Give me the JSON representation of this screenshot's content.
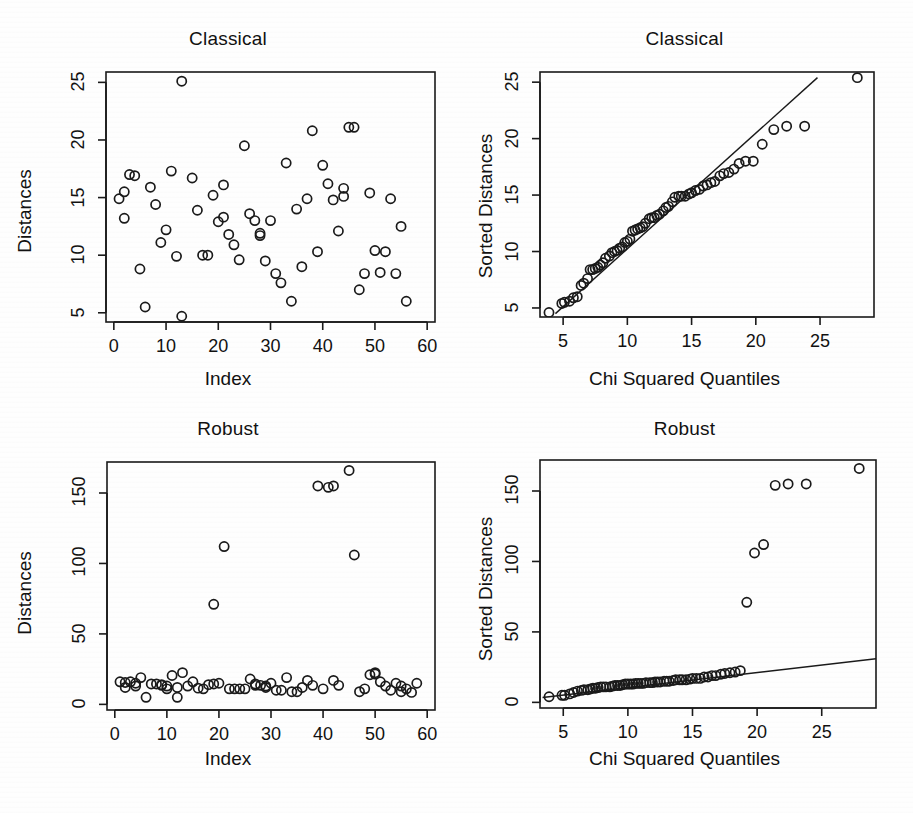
{
  "figure": {
    "width": 913,
    "height": 813,
    "background": "#fefefe",
    "ink": "#1a1a1a"
  },
  "chart_data": [
    {
      "panel_id": "classical-index",
      "type": "scatter",
      "title": "Classical",
      "xlabel": "Index",
      "ylabel": "Distances",
      "xlim": [
        -1.5,
        61.5
      ],
      "ylim": [
        4.2,
        25.9
      ],
      "xticks": [
        0,
        10,
        20,
        30,
        40,
        50,
        60
      ],
      "yticks": [
        5,
        10,
        15,
        20,
        25
      ],
      "grid": false,
      "legend": null,
      "marker": "open-circle",
      "points": [
        [
          1,
          14.9
        ],
        [
          2,
          13.2
        ],
        [
          2,
          15.5
        ],
        [
          3,
          17.0
        ],
        [
          4,
          16.9
        ],
        [
          5,
          8.8
        ],
        [
          6,
          5.5
        ],
        [
          7,
          15.9
        ],
        [
          8,
          14.4
        ],
        [
          9,
          11.1
        ],
        [
          10,
          12.2
        ],
        [
          11,
          17.3
        ],
        [
          12,
          9.9
        ],
        [
          13,
          25.1
        ],
        [
          13,
          4.7
        ],
        [
          15,
          16.7
        ],
        [
          16,
          13.9
        ],
        [
          17,
          10.0
        ],
        [
          18,
          10.0
        ],
        [
          19,
          15.2
        ],
        [
          20,
          12.9
        ],
        [
          21,
          13.3
        ],
        [
          21,
          16.1
        ],
        [
          22,
          11.8
        ],
        [
          23,
          10.9
        ],
        [
          24,
          9.6
        ],
        [
          25,
          19.5
        ],
        [
          26,
          13.6
        ],
        [
          27,
          13.0
        ],
        [
          28,
          11.9
        ],
        [
          28,
          11.7
        ],
        [
          29,
          9.5
        ],
        [
          30,
          13.0
        ],
        [
          31,
          8.4
        ],
        [
          32,
          7.6
        ],
        [
          33,
          18.0
        ],
        [
          34,
          6.0
        ],
        [
          35,
          14.0
        ],
        [
          36,
          9.0
        ],
        [
          37,
          14.9
        ],
        [
          38,
          20.8
        ],
        [
          39,
          10.3
        ],
        [
          40,
          17.8
        ],
        [
          41,
          16.2
        ],
        [
          42,
          14.8
        ],
        [
          43,
          12.1
        ],
        [
          44,
          15.8
        ],
        [
          44,
          15.1
        ],
        [
          45,
          21.1
        ],
        [
          46,
          21.1
        ],
        [
          47,
          7.0
        ],
        [
          48,
          8.4
        ],
        [
          49,
          15.4
        ],
        [
          50,
          10.4
        ],
        [
          51,
          8.5
        ],
        [
          52,
          10.3
        ],
        [
          53,
          14.9
        ],
        [
          54,
          8.4
        ],
        [
          55,
          12.5
        ],
        [
          56,
          6.0
        ]
      ]
    },
    {
      "panel_id": "classical-qq",
      "type": "scatter",
      "title": "Classical",
      "xlabel": "Chi Squared Quantiles",
      "ylabel": "Sorted Distances",
      "xlim": [
        3.2,
        29.2
      ],
      "ylim": [
        4.2,
        25.9
      ],
      "xticks": [
        5,
        10,
        15,
        20,
        25
      ],
      "yticks": [
        5,
        10,
        15,
        20,
        25
      ],
      "grid": false,
      "legend": null,
      "marker": "open-circle",
      "reference_line": {
        "type": "straight",
        "x0": 4.4,
        "y0": 4.5,
        "x1": 24.8,
        "y1": 25.4
      },
      "points": [
        [
          3.9,
          4.6
        ],
        [
          4.9,
          5.4
        ],
        [
          5.1,
          5.5
        ],
        [
          5.5,
          5.6
        ],
        [
          5.8,
          5.9
        ],
        [
          6.1,
          6.0
        ],
        [
          6.4,
          7.0
        ],
        [
          6.6,
          7.2
        ],
        [
          6.9,
          7.6
        ],
        [
          7.1,
          8.4
        ],
        [
          7.3,
          8.4
        ],
        [
          7.5,
          8.5
        ],
        [
          7.7,
          8.6
        ],
        [
          7.9,
          8.8
        ],
        [
          8.1,
          9.0
        ],
        [
          8.3,
          9.4
        ],
        [
          8.6,
          9.6
        ],
        [
          8.8,
          9.9
        ],
        [
          9.0,
          10.0
        ],
        [
          9.2,
          10.1
        ],
        [
          9.4,
          10.3
        ],
        [
          9.6,
          10.4
        ],
        [
          9.8,
          10.8
        ],
        [
          10.0,
          10.9
        ],
        [
          10.2,
          11.1
        ],
        [
          10.4,
          11.8
        ],
        [
          10.6,
          11.9
        ],
        [
          10.8,
          12.0
        ],
        [
          11.0,
          12.1
        ],
        [
          11.2,
          12.2
        ],
        [
          11.4,
          12.5
        ],
        [
          11.7,
          12.9
        ],
        [
          11.9,
          13.0
        ],
        [
          12.1,
          13.0
        ],
        [
          12.3,
          13.2
        ],
        [
          12.5,
          13.3
        ],
        [
          12.8,
          13.6
        ],
        [
          13.0,
          13.9
        ],
        [
          13.2,
          14.0
        ],
        [
          13.5,
          14.4
        ],
        [
          13.7,
          14.8
        ],
        [
          14.0,
          14.9
        ],
        [
          14.2,
          14.9
        ],
        [
          14.5,
          14.9
        ],
        [
          14.8,
          15.1
        ],
        [
          15.0,
          15.2
        ],
        [
          15.3,
          15.4
        ],
        [
          15.6,
          15.5
        ],
        [
          15.9,
          15.8
        ],
        [
          16.2,
          15.9
        ],
        [
          16.5,
          16.1
        ],
        [
          16.8,
          16.2
        ],
        [
          17.2,
          16.7
        ],
        [
          17.5,
          16.9
        ],
        [
          17.9,
          17.0
        ],
        [
          18.3,
          17.3
        ],
        [
          18.7,
          17.8
        ],
        [
          19.2,
          18.0
        ],
        [
          19.8,
          18.0
        ],
        [
          20.5,
          19.5
        ],
        [
          21.4,
          20.8
        ],
        [
          22.4,
          21.1
        ],
        [
          23.8,
          21.1
        ],
        [
          27.9,
          25.4
        ]
      ]
    },
    {
      "panel_id": "robust-index",
      "type": "scatter",
      "title": "Robust",
      "xlabel": "Index",
      "ylabel": "Distances",
      "xlim": [
        -1.5,
        61.5
      ],
      "ylim": [
        -4,
        172
      ],
      "xticks": [
        0,
        10,
        20,
        30,
        40,
        50,
        60
      ],
      "yticks": [
        0,
        50,
        100,
        150
      ],
      "grid": false,
      "legend": null,
      "marker": "open-circle",
      "points": [
        [
          1,
          16.0
        ],
        [
          2,
          15.5
        ],
        [
          2,
          12.0
        ],
        [
          3,
          16.0
        ],
        [
          4,
          15.0
        ],
        [
          4,
          13.0
        ],
        [
          5,
          19.0
        ],
        [
          6,
          5.0
        ],
        [
          7,
          14.5
        ],
        [
          8,
          14.5
        ],
        [
          9,
          13.5
        ],
        [
          9,
          14.0
        ],
        [
          10,
          13.0
        ],
        [
          10,
          11.0
        ],
        [
          11,
          20.5
        ],
        [
          12,
          12.0
        ],
        [
          12,
          5.0
        ],
        [
          13,
          22.5
        ],
        [
          14,
          13.0
        ],
        [
          15,
          16.0
        ],
        [
          16,
          11.5
        ],
        [
          17,
          11.0
        ],
        [
          18,
          14.0
        ],
        [
          19,
          14.5
        ],
        [
          19,
          71.0
        ],
        [
          20,
          15.0
        ],
        [
          21,
          112.0
        ],
        [
          22,
          11.0
        ],
        [
          23,
          11.0
        ],
        [
          24,
          11.0
        ],
        [
          25,
          11.0
        ],
        [
          26,
          18.0
        ],
        [
          27,
          14.5
        ],
        [
          27,
          13.5
        ],
        [
          28,
          13.5
        ],
        [
          29,
          13.0
        ],
        [
          29,
          12.0
        ],
        [
          30,
          15.0
        ],
        [
          31,
          10.0
        ],
        [
          32,
          10.0
        ],
        [
          33,
          19.0
        ],
        [
          34,
          9.0
        ],
        [
          35,
          9.0
        ],
        [
          36,
          12.0
        ],
        [
          37,
          17.0
        ],
        [
          38,
          13.5
        ],
        [
          39,
          155.0
        ],
        [
          40,
          11.0
        ],
        [
          41,
          154.0
        ],
        [
          42,
          155.0
        ],
        [
          42,
          17.0
        ],
        [
          43,
          13.5
        ],
        [
          45,
          166.0
        ],
        [
          46,
          106.0
        ],
        [
          47,
          9.0
        ],
        [
          48,
          11.0
        ],
        [
          49,
          21.0
        ],
        [
          50,
          21.5
        ],
        [
          50,
          22.5
        ],
        [
          51,
          16.0
        ],
        [
          52,
          13.0
        ],
        [
          53,
          10.0
        ],
        [
          54,
          15.0
        ],
        [
          55,
          13.0
        ],
        [
          55,
          9.0
        ],
        [
          56,
          11.0
        ],
        [
          57,
          8.5
        ],
        [
          58,
          15.0
        ]
      ]
    },
    {
      "panel_id": "robust-qq",
      "type": "scatter",
      "title": "Robust",
      "xlabel": "Chi Squared Quantiles",
      "ylabel": "Sorted Distances",
      "xlim": [
        3.2,
        29.2
      ],
      "ylim": [
        -4,
        172
      ],
      "xticks": [
        5,
        10,
        15,
        20,
        25
      ],
      "yticks": [
        0,
        50,
        100,
        150
      ],
      "grid": false,
      "legend": null,
      "marker": "open-circle",
      "reference_line": {
        "type": "straight",
        "x0": 3.4,
        "y0": 3.5,
        "x1": 29.2,
        "y1": 31.0
      },
      "points": [
        [
          3.9,
          4.0
        ],
        [
          4.9,
          5.0
        ],
        [
          5.1,
          5.0
        ],
        [
          5.5,
          6.0
        ],
        [
          5.8,
          7.0
        ],
        [
          6.1,
          8.0
        ],
        [
          6.4,
          8.5
        ],
        [
          6.6,
          9.0
        ],
        [
          6.9,
          9.0
        ],
        [
          7.1,
          9.5
        ],
        [
          7.3,
          10.0
        ],
        [
          7.5,
          10.0
        ],
        [
          7.7,
          10.5
        ],
        [
          7.9,
          11.0
        ],
        [
          8.1,
          11.0
        ],
        [
          8.3,
          11.0
        ],
        [
          8.6,
          11.0
        ],
        [
          8.8,
          11.5
        ],
        [
          9.0,
          12.0
        ],
        [
          9.2,
          12.0
        ],
        [
          9.4,
          12.0
        ],
        [
          9.6,
          12.5
        ],
        [
          9.8,
          13.0
        ],
        [
          10.0,
          13.0
        ],
        [
          10.2,
          13.0
        ],
        [
          10.4,
          13.0
        ],
        [
          10.6,
          13.5
        ],
        [
          10.8,
          13.5
        ],
        [
          11.0,
          13.5
        ],
        [
          11.2,
          13.5
        ],
        [
          11.4,
          14.0
        ],
        [
          11.7,
          14.0
        ],
        [
          11.9,
          14.0
        ],
        [
          12.1,
          14.5
        ],
        [
          12.3,
          14.5
        ],
        [
          12.5,
          14.5
        ],
        [
          12.8,
          15.0
        ],
        [
          13.0,
          15.0
        ],
        [
          13.2,
          15.0
        ],
        [
          13.5,
          15.5
        ],
        [
          13.7,
          16.0
        ],
        [
          14.0,
          16.0
        ],
        [
          14.2,
          16.0
        ],
        [
          14.5,
          16.0
        ],
        [
          14.8,
          16.5
        ],
        [
          15.0,
          17.0
        ],
        [
          15.3,
          17.0
        ],
        [
          15.6,
          17.0
        ],
        [
          15.9,
          18.0
        ],
        [
          16.2,
          18.0
        ],
        [
          16.5,
          19.0
        ],
        [
          16.8,
          19.0
        ],
        [
          17.2,
          20.0
        ],
        [
          17.5,
          20.5
        ],
        [
          17.9,
          21.0
        ],
        [
          18.3,
          21.5
        ],
        [
          18.7,
          22.5
        ],
        [
          19.2,
          71.0
        ],
        [
          19.8,
          106.0
        ],
        [
          20.5,
          112.0
        ],
        [
          21.4,
          154.0
        ],
        [
          22.4,
          155.0
        ],
        [
          23.8,
          155.0
        ],
        [
          27.9,
          166.0
        ]
      ]
    }
  ]
}
